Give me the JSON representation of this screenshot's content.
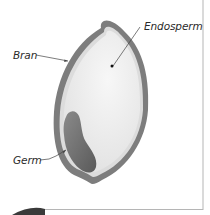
{
  "diagram": {
    "labels": [
      {
        "id": "endosperm",
        "text": "Endosperm"
      },
      {
        "id": "bran",
        "text": "Bran"
      },
      {
        "id": "germ",
        "text": "Germ"
      }
    ],
    "colors": {
      "bran": "#7d7d7d",
      "endosperm": "#ededed",
      "endosperm_inner_layer": "#dcdcdc",
      "germ": "#6a6a6a",
      "leader_line": "#444444",
      "frame_border": "#b5b5b5",
      "bottom_shape": "#3a3a3a"
    }
  }
}
